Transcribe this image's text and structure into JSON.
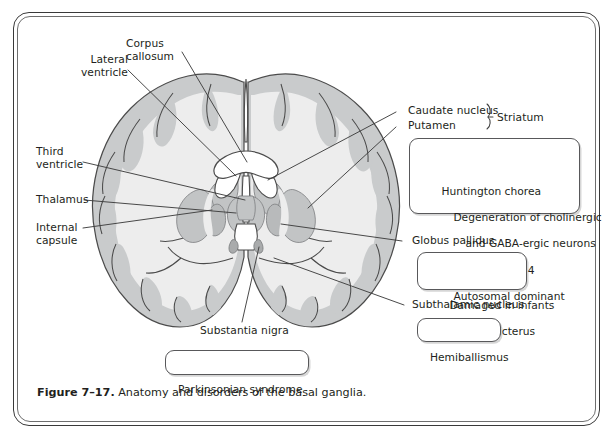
{
  "figure": {
    "number": "Figure 7–17.",
    "caption": " Anatomy and disorders of the basal ganglia."
  },
  "labels": {
    "lateral_ventricle_l1": "Lateral",
    "lateral_ventricle_l2": "ventricle",
    "corpus_callosum_l1": "Corpus",
    "corpus_callosum_l2": "callosum",
    "third_ventricle_l1": "Third",
    "third_ventricle_l2": "ventricle",
    "thalamus": "Thalamus",
    "internal_capsule_l1": "Internal",
    "internal_capsule_l2": "capsule",
    "caudate_nucleus": "Caudate nucleus",
    "putamen": "Putamen",
    "striatum": "Striatum",
    "globus_pallidus": "Globus pallidus",
    "subthalamic_nucleus": "Subthalamic nucleus",
    "substantia_nigra": "Substantia nigra"
  },
  "boxes": {
    "huntington": {
      "line1": "Huntington chorea",
      "line2": "Degeneration of cholinergic",
      "line3": "and GABA-ergic neurons",
      "line4": "Chromosome 4",
      "line5": "Autosomal dominant"
    },
    "kernicterus": {
      "line1": "Damaged in infants",
      "line2": "with kernicterus"
    },
    "hemiballismus": {
      "line1": "Hemiballismus"
    },
    "parkinsonian": {
      "line1": "Parkinsonian syndrome"
    }
  },
  "colors": {
    "frame_outer": "#3a3a3a",
    "frame_inner": "#6e6e6e",
    "text": "#231f20",
    "white_matter": "#ededed",
    "gray_matter": "#c9cbcc",
    "deep_nuclei": "#c2c4c5",
    "outline": "#4b4b4b",
    "leader_line": "#3f3f3f",
    "box_border": "#58585a",
    "ventricle": "#ffffff"
  }
}
